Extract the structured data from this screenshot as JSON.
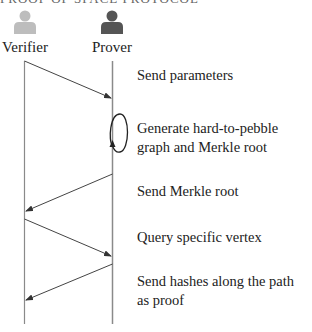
{
  "title": "PROOF OF SPACE PROTOCOL",
  "actors": [
    {
      "label": "Verifier",
      "icon": "person-icon",
      "color": "#bdbdbd"
    },
    {
      "label": "Prover",
      "icon": "person-icon",
      "color": "#555555"
    }
  ],
  "messages": [
    {
      "from": "Verifier",
      "to": "Prover",
      "text": "Send parameters"
    },
    {
      "from": "Prover",
      "to": "Prover",
      "text": "Generate hard-to-pebble graph and Merkle root"
    },
    {
      "from": "Prover",
      "to": "Verifier",
      "text": "Send Merkle root"
    },
    {
      "from": "Verifier",
      "to": "Prover",
      "text": "Query specific vertex"
    },
    {
      "from": "Prover",
      "to": "Verifier",
      "text": "Send hashes along the path as proof"
    }
  ],
  "colors": {
    "lifeline": "#8a8a8a",
    "arrow": "#444444"
  }
}
